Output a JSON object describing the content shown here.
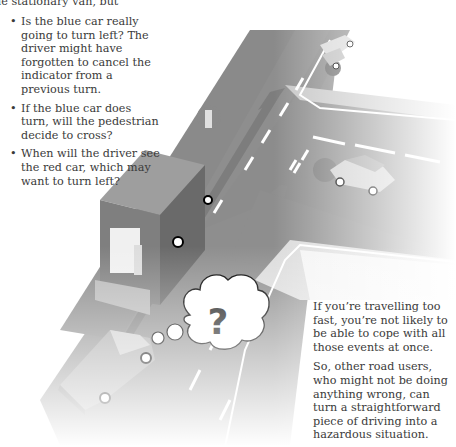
{
  "intro_fragment": "he stationary van, but",
  "questions": [
    "Is the blue car really going to turn left? The driver might have forgotten to cancel the indicator from a previous turn.",
    "If the blue car does turn, will the pedestrian decide to cross?",
    "When will the driver see the red car, which may want to turn left?"
  ],
  "conclusion": [
    "If you’re travelling too fast, you’re not likely to be able to cope with all those events at once.",
    "So, other road users, who might not be doing anything wrong, can turn a straightforward piece of driving into a hazardous situation."
  ],
  "illustration": {
    "thought_bubble_symbol": "?",
    "colors": {
      "road": "#8c8c8c",
      "lines": "#ffffff",
      "van": "#6e6e6e",
      "van_side": "#5a5a5a",
      "car": "#9a9a9a",
      "highlight": "#777777"
    }
  }
}
